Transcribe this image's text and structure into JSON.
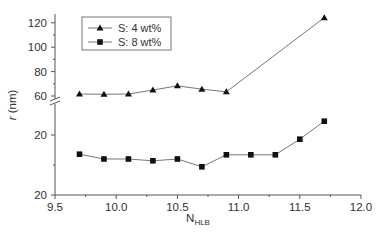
{
  "chart_data": {
    "type": "line",
    "title": "",
    "xlabel": "N",
    "xlabel_subscript": "HLB",
    "ylabel_italic": "r",
    "ylabel_rest": " (nm)",
    "x_ticks": [
      "9.5",
      "10.0",
      "10.5",
      "11.0",
      "11.5",
      "12.0"
    ],
    "xlim": [
      9.5,
      12.0
    ],
    "y_axis_broken": true,
    "upper_segment": {
      "ylim": [
        58,
        128
      ],
      "ticks": [
        "60",
        "80",
        "100",
        "120"
      ]
    },
    "lower_segment": {
      "ylim": [
        20,
        30
      ],
      "tick_labels_as_printed": [
        "20",
        "20"
      ]
    },
    "grid": false,
    "legend_position": "upper-left-inside",
    "series": [
      {
        "name": "S: 4 wt%",
        "marker": "triangle",
        "x": [
          9.7,
          9.9,
          10.1,
          10.3,
          10.5,
          10.7,
          10.9,
          11.7
        ],
        "y": [
          61.6,
          61.4,
          61.6,
          64.9,
          68.3,
          65.6,
          63.4,
          124.2
        ]
      },
      {
        "name": "S: 8 wt%",
        "marker": "square",
        "x": [
          9.7,
          9.9,
          10.1,
          10.3,
          10.5,
          10.7,
          10.9,
          11.1,
          11.3,
          11.5,
          11.7
        ],
        "y": [
          26.8,
          26.0,
          26.0,
          25.7,
          26.0,
          24.7,
          26.7,
          26.7,
          26.7,
          29.3,
          32.3
        ]
      }
    ]
  }
}
